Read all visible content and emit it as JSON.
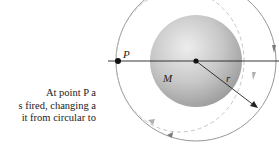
{
  "caption": {
    "lines": [
      "At point P a",
      "s fired, changing a",
      "it from circular to"
    ]
  },
  "diagram": {
    "labels": {
      "point": "P",
      "mass": "M",
      "radius": "r"
    },
    "colors": {
      "planet_light": "#e6e6e6",
      "planet_dark": "#9a9a9a",
      "orbit": "#8a8a8a",
      "dashed_orbit": "#bdbdbd",
      "axis": "#222222",
      "arrow_solid": "#7a7a7a",
      "arrow_dashed": "#b0b0b0"
    }
  }
}
